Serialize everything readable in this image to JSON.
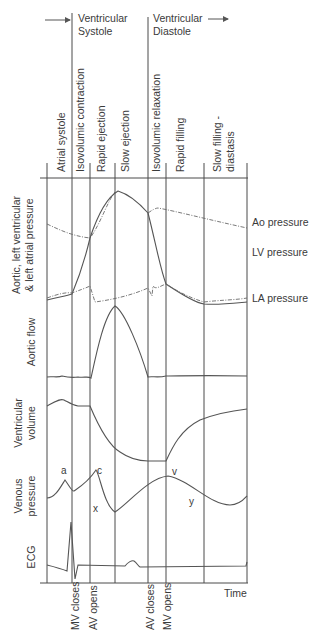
{
  "header": {
    "systole_line1": "Ventricular",
    "systole_line2": "Systole",
    "diastole_line1": "Ventricular",
    "diastole_line2": "Diastole"
  },
  "phases": [
    {
      "label": "Atrial systole"
    },
    {
      "label": "Isovolumic contraction"
    },
    {
      "label": "Rapid ejection"
    },
    {
      "label": "Slow ejection"
    },
    {
      "label": "Isovolumic relaxation"
    },
    {
      "label": "Rapid filling"
    },
    {
      "label": "Slow filling -"
    },
    {
      "label": "diastasis"
    }
  ],
  "row_labels": {
    "pressure_line1": "Aortic, left ventricular",
    "pressure_line2": "& left atrial pressure",
    "aortic_flow": "Aortic flow",
    "volume_line1": "Ventricular",
    "volume_line2": "volume",
    "venous_line1": "Venous",
    "venous_line2": "pressure",
    "ecg": "ECG"
  },
  "legend": {
    "ao": "Ao pressure",
    "lv": "LV pressure",
    "la": "LA pressure"
  },
  "wave_labels": {
    "a": "a",
    "c": "c",
    "x": "x",
    "v": "v",
    "y": "y"
  },
  "events": {
    "mv_closes": "MV closes",
    "av_opens": "AV opens",
    "av_closes": "AV closes",
    "mv_opens": "MV opens"
  },
  "axis": {
    "time": "Time"
  }
}
